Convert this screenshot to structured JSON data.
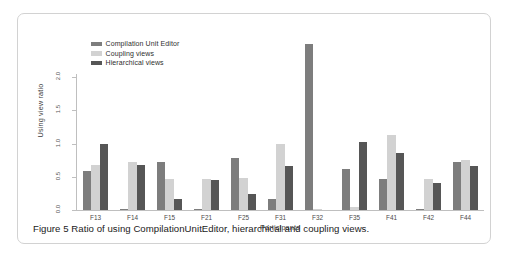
{
  "figure": {
    "caption": "Figure 5 Ratio of using CompilationUnitEditor, hierarchical and coupling views."
  },
  "colors": {
    "series_compilation_unit_editor": "#7d7d7d",
    "series_coupling_views": "#d2d2d2",
    "series_hierarchical_views": "#565656",
    "axis": "#bfbfbf",
    "card_border": "#d2d2d2",
    "background": "#ffffff"
  },
  "chart_data": {
    "type": "bar",
    "title": "",
    "xlabel": "Participants",
    "ylabel": "Using view ratio",
    "ylim": [
      0,
      2.6
    ],
    "yticks": [
      0.0,
      0.5,
      1.0,
      1.5,
      2.0
    ],
    "ytick_labels": [
      "0.0",
      "0.5",
      "1.0",
      "1.5",
      "2.0"
    ],
    "grid": false,
    "legend_position": "top-left",
    "categories": [
      "F13",
      "F14",
      "F15",
      "F21",
      "F25",
      "F31",
      "F32",
      "F35",
      "F41",
      "F42",
      "F44"
    ],
    "series": [
      {
        "name": "Compilation Unit Editor",
        "color": "#7d7d7d",
        "values": [
          0.58,
          0.01,
          0.72,
          0.01,
          0.78,
          0.16,
          2.5,
          0.62,
          0.46,
          0.02,
          0.72
        ]
      },
      {
        "name": "Coupling views",
        "color": "#d2d2d2",
        "values": [
          0.67,
          0.72,
          0.46,
          0.47,
          0.48,
          0.99,
          0.01,
          0.05,
          1.13,
          0.46,
          0.75
        ]
      },
      {
        "name": "Hierarchical views",
        "color": "#565656",
        "values": [
          1.0,
          0.68,
          0.16,
          0.45,
          0.24,
          0.66,
          0.0,
          1.03,
          0.85,
          0.41,
          0.66
        ]
      }
    ]
  }
}
